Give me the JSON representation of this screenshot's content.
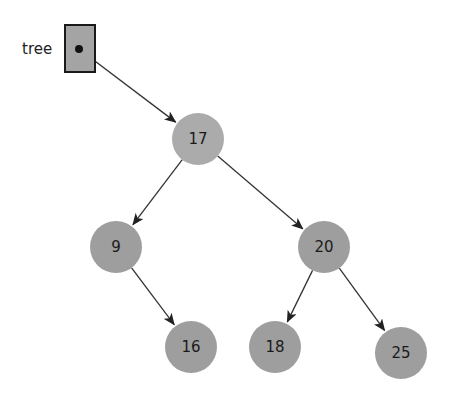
{
  "diagram": {
    "type": "binary-search-tree",
    "colors": {
      "background": "#ffffff",
      "node_fill": "#9e9e9e",
      "root_fill": "#ababab",
      "pointer_box_fill": "#a4a4a4",
      "edge": "#333333",
      "text": "#1a1a1a"
    },
    "pointer": {
      "label": "tree",
      "box": {
        "x": 65,
        "y": 25,
        "w": 30,
        "h": 47
      },
      "dot": {
        "x": 79,
        "y": 49
      },
      "target": "17"
    },
    "nodes": [
      {
        "id": "17",
        "label": "17",
        "cx": 198,
        "cy": 139,
        "r": 26
      },
      {
        "id": "9",
        "label": "9",
        "cx": 116,
        "cy": 247,
        "r": 26
      },
      {
        "id": "20",
        "label": "20",
        "cx": 324,
        "cy": 247,
        "r": 26
      },
      {
        "id": "16",
        "label": "16",
        "cx": 191,
        "cy": 347,
        "r": 26
      },
      {
        "id": "18",
        "label": "18",
        "cx": 275,
        "cy": 347,
        "r": 26
      },
      {
        "id": "25",
        "label": "25",
        "cx": 401,
        "cy": 353,
        "r": 26
      }
    ],
    "edges": [
      {
        "from": "17",
        "to": "9"
      },
      {
        "from": "17",
        "to": "20"
      },
      {
        "from": "9",
        "to": "16"
      },
      {
        "from": "20",
        "to": "18"
      },
      {
        "from": "20",
        "to": "25"
      }
    ]
  }
}
